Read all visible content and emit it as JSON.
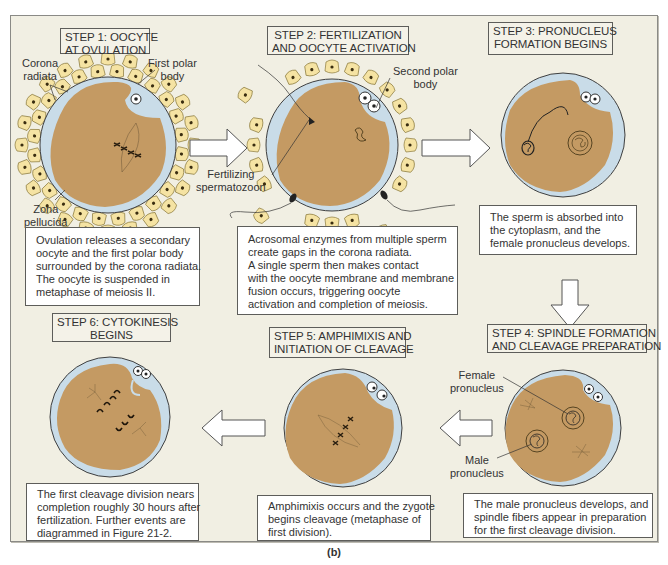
{
  "figure": {
    "caption": "(b)",
    "colors": {
      "panel_bg": "#f1efe3",
      "cytoplasm": "#c49a63",
      "zona_pellucida": "#c9dce8",
      "corona_cells": "#f5e3a3",
      "box_border": "#5d5d5a"
    }
  },
  "steps": [
    {
      "id": 1,
      "title_lines": [
        "STEP 1: OOCYTE",
        "AT OVULATION"
      ],
      "labels": {
        "corona": [
          "Corona",
          "radiata"
        ],
        "polar": [
          "First polar",
          "body"
        ],
        "zona": [
          "Zona",
          "pellucida"
        ]
      },
      "desc_lines": [
        "Ovulation releases a secondary",
        "oocyte and the first polar body",
        "surrounded by the corona radiata.",
        "The oocyte is suspended in",
        "metaphase of meiosis II."
      ]
    },
    {
      "id": 2,
      "title_lines": [
        "STEP 2: FERTILIZATION",
        "AND OOCYTE ACTIVATION"
      ],
      "labels": {
        "polar": [
          "Second polar",
          "body"
        ],
        "sperm": [
          "Fertilizing",
          "spermatozoon"
        ]
      },
      "desc_lines": [
        "Acrosomal enzymes from multiple sperm",
        "create gaps in the corona radiata.",
        "A single sperm then makes contact",
        "with the oocyte membrane and membrane",
        "fusion occurs, triggering oocyte",
        "activation and completion of meiosis."
      ]
    },
    {
      "id": 3,
      "title_lines": [
        "STEP 3: PRONUCLEUS",
        "FORMATION BEGINS"
      ],
      "desc_lines": [
        "The sperm is absorbed into",
        "the cytoplasm, and the",
        "female pronucleus develops."
      ]
    },
    {
      "id": 4,
      "title_lines": [
        "STEP 4: SPINDLE FORMATION",
        "AND  CLEAVAGE PREPARATION"
      ],
      "labels": {
        "female": [
          "Female",
          "pronucleus"
        ],
        "male": [
          "Male",
          "pronucleus"
        ]
      },
      "desc_lines": [
        "The male pronucleus develops, and",
        "spindle fibers appear in preparation",
        "for the first cleavage division."
      ]
    },
    {
      "id": 5,
      "title_lines": [
        "STEP 5: AMPHIMIXIS AND",
        "INITIATION OF CLEAVAGE"
      ],
      "desc_lines": [
        "Amphimixis occurs and the zygote",
        "begins cleavage (metaphase of",
        "first division)."
      ]
    },
    {
      "id": 6,
      "title_lines": [
        "STEP 6: CYTOKINESIS",
        "BEGINS"
      ],
      "desc_lines": [
        "The first cleavage division nears",
        "completion roughly 30 hours after",
        "fertilization. Further events are",
        "diagrammed in Figure 21-2."
      ]
    }
  ]
}
